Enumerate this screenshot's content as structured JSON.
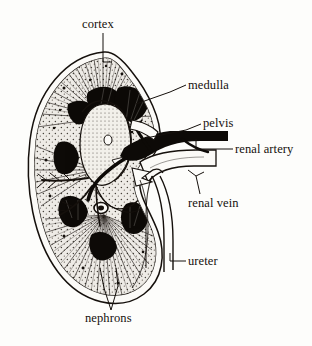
{
  "figure": {
    "style": "engraved line drawing, black ink on paper",
    "background_color": "#fdfdfb",
    "ink_color": "#15100c",
    "width": 312,
    "height": 346
  },
  "labels": [
    {
      "id": "cortex",
      "text": "cortex",
      "x": 82,
      "y": 18
    },
    {
      "id": "medulla",
      "text": "medulla",
      "x": 188,
      "y": 79
    },
    {
      "id": "pelvis",
      "text": "pelvis",
      "x": 203,
      "y": 117
    },
    {
      "id": "renal_artery",
      "text": "renal artery",
      "x": 235,
      "y": 143
    },
    {
      "id": "renal_vein",
      "text": "renal vein",
      "x": 188,
      "y": 197
    },
    {
      "id": "ureter",
      "text": "ureter",
      "x": 188,
      "y": 255
    },
    {
      "id": "nephrons",
      "text": "nephrons",
      "x": 85,
      "y": 312
    }
  ],
  "structures": [
    {
      "id": "capsule",
      "name": "renal capsule outline"
    },
    {
      "id": "cortex",
      "name": "cortex with radial striations"
    },
    {
      "id": "medulla",
      "name": "medullary pyramids"
    },
    {
      "id": "pelvis",
      "name": "renal pelvis"
    },
    {
      "id": "renal_artery",
      "name": "renal artery"
    },
    {
      "id": "renal_vein",
      "name": "renal vein"
    },
    {
      "id": "ureter",
      "name": "ureter"
    },
    {
      "id": "nephrons",
      "name": "nephrons"
    }
  ]
}
